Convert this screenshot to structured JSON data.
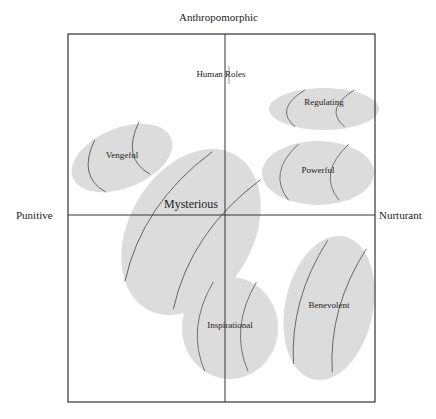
{
  "axes": {
    "top": "Anthropomorphic",
    "left": "Punitive",
    "right": "Nurturant"
  },
  "annotation": "Human Roles",
  "clusters": [
    {
      "label": "Regulating",
      "cx": 324,
      "cy": 109,
      "rx": 55,
      "ry": 21,
      "rot": 0
    },
    {
      "label": "Vengeful",
      "cx": 122,
      "cy": 158,
      "rx": 53,
      "ry": 30,
      "rot": -22
    },
    {
      "label": "Powerful",
      "cx": 318,
      "cy": 173,
      "rx": 56,
      "ry": 32,
      "rot": 0
    },
    {
      "label": "Mysterious",
      "cx": 191,
      "cy": 232,
      "rx": 62,
      "ry": 89,
      "rot": 30
    },
    {
      "label": "Inspirational",
      "cx": 230,
      "cy": 328,
      "rx": 48,
      "ry": 51,
      "rot": 0
    },
    {
      "label": "Benevolent",
      "cx": 329,
      "cy": 308,
      "rx": 44,
      "ry": 73,
      "rot": 12
    }
  ],
  "colors": {
    "cluster_fill": "#dcdcdc",
    "frame": "#333333",
    "curve": "#555555"
  }
}
